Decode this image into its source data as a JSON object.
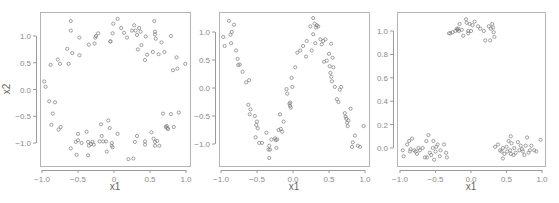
{
  "chart_data": [
    {
      "type": "scatter",
      "panel": 1,
      "title": "",
      "xlabel": "x1",
      "ylabel": "x2",
      "xlim": [
        -1.0,
        1.0
      ],
      "ylim": [
        -1.35,
        1.35
      ],
      "xticks": [
        -1.0,
        -0.5,
        0,
        0.5,
        1.0
      ],
      "xtick_labels": [
        "-1.0",
        "-0.5",
        "0",
        "0.5",
        "1.0"
      ],
      "yticks": [
        1.0,
        0.5,
        0.0,
        -0.5,
        -1.0
      ],
      "ytick_labels": [
        "1.0",
        "0.5",
        "0.0",
        "-0.5",
        "-1.0"
      ],
      "grid": false,
      "marker": "open-circle",
      "description": "Points arranged in a noisy ring (circle of radius ~1)",
      "points": [
        [
          -0.97,
          0.15
        ],
        [
          -0.95,
          0.05
        ],
        [
          -0.88,
          0.46
        ],
        [
          -0.78,
          0.56
        ],
        [
          -0.75,
          0.48
        ],
        [
          -0.65,
          0.76
        ],
        [
          -0.63,
          0.48
        ],
        [
          -0.58,
          0.68
        ],
        [
          -0.6,
          1.1
        ],
        [
          -0.6,
          1.28
        ],
        [
          -0.48,
          0.97
        ],
        [
          -0.48,
          0.64
        ],
        [
          -0.35,
          0.84
        ],
        [
          -0.27,
          0.86
        ],
        [
          -0.26,
          0.97
        ],
        [
          -0.25,
          1.0
        ],
        [
          -0.22,
          1.05
        ],
        [
          -0.05,
          0.9
        ],
        [
          -0.05,
          0.9
        ],
        [
          -0.02,
          1.05
        ],
        [
          -0.01,
          1.23
        ],
        [
          0.05,
          1.32
        ],
        [
          0.1,
          1.15
        ],
        [
          0.14,
          1.06
        ],
        [
          0.18,
          0.97
        ],
        [
          0.25,
          1.1
        ],
        [
          0.28,
          1.2
        ],
        [
          0.3,
          1.1
        ],
        [
          0.32,
          1.02
        ],
        [
          0.33,
          0.75
        ],
        [
          0.35,
          1.15
        ],
        [
          0.37,
          1.08
        ],
        [
          0.38,
          0.83
        ],
        [
          0.43,
          0.55
        ],
        [
          0.44,
          0.99
        ],
        [
          0.46,
          0.65
        ],
        [
          0.54,
          0.7
        ],
        [
          0.56,
          1.28
        ],
        [
          0.57,
          1.08
        ],
        [
          0.57,
          1.03
        ],
        [
          0.58,
          0.95
        ],
        [
          0.62,
          0.66
        ],
        [
          0.66,
          0.88
        ],
        [
          0.7,
          0.7
        ],
        [
          0.79,
          1.0
        ],
        [
          0.82,
          0.36
        ],
        [
          0.87,
          0.6
        ],
        [
          0.88,
          0.39
        ],
        [
          0.99,
          0.48
        ],
        [
          -0.9,
          -0.22
        ],
        [
          -0.82,
          -0.24
        ],
        [
          -0.85,
          -0.45
        ],
        [
          -0.87,
          -0.66
        ],
        [
          -0.77,
          -0.75
        ],
        [
          -0.74,
          -0.7
        ],
        [
          -0.6,
          -1.1
        ],
        [
          -0.53,
          -0.98
        ],
        [
          -0.5,
          -0.83
        ],
        [
          -0.5,
          -0.95
        ],
        [
          -0.52,
          -1.22
        ],
        [
          -0.45,
          -1.0
        ],
        [
          -0.38,
          -0.79
        ],
        [
          -0.36,
          -0.98
        ],
        [
          -0.36,
          -1.23
        ],
        [
          -0.35,
          -1.05
        ],
        [
          -0.32,
          -1.02
        ],
        [
          -0.3,
          -0.98
        ],
        [
          -0.28,
          -1.03
        ],
        [
          -0.2,
          -0.97
        ],
        [
          -0.18,
          -0.65
        ],
        [
          -0.17,
          -0.87
        ],
        [
          -0.15,
          -0.97
        ],
        [
          -0.11,
          -0.97
        ],
        [
          -0.1,
          -1.16
        ],
        [
          -0.08,
          -0.58
        ],
        [
          -0.06,
          -0.72
        ],
        [
          -0.03,
          -1.0
        ],
        [
          -0.03,
          -1.05
        ],
        [
          -0.02,
          -1.08
        ],
        [
          0.05,
          -0.83
        ],
        [
          0.2,
          -1.3
        ],
        [
          0.27,
          -1.29
        ],
        [
          0.29,
          -0.98
        ],
        [
          0.32,
          -0.87
        ],
        [
          0.43,
          -0.97
        ],
        [
          0.43,
          -1.03
        ],
        [
          0.52,
          -0.8
        ],
        [
          0.55,
          -0.92
        ],
        [
          0.57,
          -0.98
        ],
        [
          0.57,
          -1.05
        ],
        [
          0.6,
          -0.96
        ],
        [
          0.63,
          -1.05
        ],
        [
          0.68,
          -0.45
        ],
        [
          0.72,
          -0.7
        ],
        [
          0.73,
          -0.68
        ],
        [
          0.74,
          -0.72
        ],
        [
          0.75,
          -0.74
        ],
        [
          0.79,
          -0.46
        ],
        [
          0.83,
          -0.7
        ],
        [
          0.9,
          -0.43
        ]
      ]
    },
    {
      "type": "scatter",
      "panel": 2,
      "title": "",
      "xlabel": "x1",
      "ylabel": "",
      "xlim": [
        -1.0,
        1.0
      ],
      "ylim": [
        -1.35,
        1.35
      ],
      "xticks": [
        -1.0,
        -0.5,
        0.0,
        0.5,
        1.0
      ],
      "xtick_labels": [
        "-1.0",
        "-0.5",
        "0.0",
        "0.5",
        "1.0"
      ],
      "yticks": [
        1.0,
        0.5,
        0.0,
        -0.5,
        -1.0
      ],
      "ytick_labels": [
        "1.0",
        "0.5",
        "0.0",
        "-0.5",
        "-1.0"
      ],
      "grid": false,
      "marker": "open-circle",
      "description": "Points following a noisy sine-like wave",
      "points": [
        [
          -0.97,
          0.91
        ],
        [
          -0.95,
          0.75
        ],
        [
          -0.89,
          1.2
        ],
        [
          -0.87,
          0.95
        ],
        [
          -0.86,
          0.8
        ],
        [
          -0.85,
          1.0
        ],
        [
          -0.82,
          1.13
        ],
        [
          -0.79,
          0.67
        ],
        [
          -0.77,
          0.52
        ],
        [
          -0.76,
          0.41
        ],
        [
          -0.74,
          0.42
        ],
        [
          -0.7,
          0.29
        ],
        [
          -0.65,
          0.1
        ],
        [
          -0.61,
          0.14
        ],
        [
          -0.62,
          -0.3
        ],
        [
          -0.59,
          -0.38
        ],
        [
          -0.6,
          -0.47
        ],
        [
          -0.53,
          -0.5
        ],
        [
          -0.51,
          -0.66
        ],
        [
          -0.5,
          -0.6
        ],
        [
          -0.49,
          -0.72
        ],
        [
          -0.52,
          -0.88
        ],
        [
          -0.47,
          -0.98
        ],
        [
          -0.43,
          -0.98
        ],
        [
          -0.37,
          -0.8
        ],
        [
          -0.34,
          -1.1
        ],
        [
          -0.33,
          -1.03
        ],
        [
          -0.32,
          -1.1
        ],
        [
          -0.33,
          -1.25
        ],
        [
          -0.3,
          -0.92
        ],
        [
          -0.25,
          -0.9
        ],
        [
          -0.24,
          -0.93
        ],
        [
          -0.23,
          -1.07
        ],
        [
          -0.22,
          -0.92
        ],
        [
          -0.2,
          -0.75
        ],
        [
          -0.18,
          -0.47
        ],
        [
          -0.17,
          -0.73
        ],
        [
          -0.15,
          -0.78
        ],
        [
          -0.13,
          -0.6
        ],
        [
          -0.09,
          -0.02
        ],
        [
          -0.08,
          -0.1
        ],
        [
          -0.05,
          -0.28
        ],
        [
          -0.04,
          -0.26
        ],
        [
          -0.04,
          -0.32
        ],
        [
          -0.03,
          -0.35
        ],
        [
          -0.02,
          0.18
        ],
        [
          -0.01,
          0.02
        ],
        [
          0.03,
          0.37
        ],
        [
          0.06,
          0.63
        ],
        [
          0.1,
          0.67
        ],
        [
          0.14,
          0.75
        ],
        [
          0.19,
          0.84
        ],
        [
          0.18,
          0.56
        ],
        [
          0.24,
          1.1
        ],
        [
          0.26,
          0.67
        ],
        [
          0.28,
          1.25
        ],
        [
          0.28,
          0.96
        ],
        [
          0.3,
          1.15
        ],
        [
          0.31,
          0.8
        ],
        [
          0.32,
          1.08
        ],
        [
          0.33,
          1.12
        ],
        [
          0.35,
          1.1
        ],
        [
          0.38,
          0.87
        ],
        [
          0.4,
          0.78
        ],
        [
          0.42,
          0.84
        ],
        [
          0.43,
          0.47
        ],
        [
          0.45,
          0.87
        ],
        [
          0.47,
          0.49
        ],
        [
          0.5,
          0.61
        ],
        [
          0.51,
          0.39
        ],
        [
          0.53,
          0.79
        ],
        [
          0.52,
          0.27
        ],
        [
          0.53,
          0.2
        ],
        [
          0.55,
          0.54
        ],
        [
          0.54,
          0.12
        ],
        [
          0.56,
          0.37
        ],
        [
          0.58,
          0.02
        ],
        [
          0.61,
          -0.2
        ],
        [
          0.63,
          -0.25
        ],
        [
          0.65,
          -0.03
        ],
        [
          0.67,
          0.02
        ],
        [
          0.72,
          -0.45
        ],
        [
          0.73,
          -0.51
        ],
        [
          0.74,
          -0.55
        ],
        [
          0.75,
          -0.62
        ],
        [
          0.76,
          -0.68
        ],
        [
          0.77,
          -0.58
        ],
        [
          0.8,
          -0.37
        ],
        [
          0.82,
          -1.05
        ],
        [
          0.83,
          -0.97
        ],
        [
          0.86,
          -0.85
        ],
        [
          0.9,
          -1.03
        ],
        [
          0.93,
          -1.05
        ],
        [
          0.98,
          -0.68
        ]
      ]
    },
    {
      "type": "scatter",
      "panel": 3,
      "title": "",
      "xlabel": "x1",
      "ylabel": "",
      "xlim": [
        -1.0,
        1.0
      ],
      "ylim": [
        -0.15,
        1.15
      ],
      "xticks": [
        -1.0,
        -0.5,
        0.0,
        0.5,
        1.0
      ],
      "xtick_labels": [
        "-1.0",
        "-0.5",
        "0.0",
        "0.5",
        "1.0"
      ],
      "yticks": [
        1.0,
        0.8,
        0.6,
        0.4,
        0.2,
        0.0
      ],
      "ytick_labels": [
        "1.0",
        "0.8",
        "0.6",
        "0.4",
        "0.2",
        "0.0"
      ],
      "grid": false,
      "marker": "open-circle",
      "description": "Three clusters: top center (~(0,1)), bottom-left (~(-0.6,0)), bottom-right (~(0.65,0))",
      "points": [
        [
          -0.31,
          0.98
        ],
        [
          -0.29,
          0.98
        ],
        [
          -0.26,
          0.99
        ],
        [
          -0.22,
          1.0
        ],
        [
          -0.2,
          1.02
        ],
        [
          -0.19,
          1.01
        ],
        [
          -0.18,
          1.02
        ],
        [
          -0.17,
          1.0
        ],
        [
          -0.16,
          1.06
        ],
        [
          -0.13,
          1.01
        ],
        [
          -0.11,
          0.96
        ],
        [
          -0.07,
          1.1
        ],
        [
          -0.06,
          1.07
        ],
        [
          -0.04,
          0.98
        ],
        [
          -0.04,
          1.0
        ],
        [
          -0.02,
          1.06
        ],
        [
          0.0,
          1.0
        ],
        [
          0.02,
          1.05
        ],
        [
          0.05,
          1.08
        ],
        [
          0.1,
          1.04
        ],
        [
          0.13,
          1.02
        ],
        [
          0.18,
          1.0
        ],
        [
          0.2,
          0.92
        ],
        [
          0.25,
          1.04
        ],
        [
          0.27,
          0.92
        ],
        [
          0.28,
          1.02
        ],
        [
          0.3,
          1.06
        ],
        [
          0.31,
          1.03
        ],
        [
          0.32,
          0.99
        ],
        [
          0.33,
          0.95
        ],
        [
          -0.96,
          -0.02
        ],
        [
          -0.95,
          -0.07
        ],
        [
          -0.9,
          0.03
        ],
        [
          -0.87,
          0.06
        ],
        [
          -0.86,
          -0.03
        ],
        [
          -0.85,
          -0.01
        ],
        [
          -0.83,
          0.08
        ],
        [
          -0.8,
          -0.02
        ],
        [
          -0.78,
          -0.03
        ],
        [
          -0.76,
          -0.05
        ],
        [
          -0.74,
          0.0
        ],
        [
          -0.72,
          -0.02
        ],
        [
          -0.68,
          0.0
        ],
        [
          -0.65,
          -0.08
        ],
        [
          -0.63,
          0.06
        ],
        [
          -0.62,
          -0.08
        ],
        [
          -0.6,
          0.11
        ],
        [
          -0.58,
          -0.04
        ],
        [
          -0.56,
          -0.06
        ],
        [
          -0.54,
          0.0
        ],
        [
          -0.53,
          0.06
        ],
        [
          -0.52,
          -0.1
        ],
        [
          -0.5,
          -0.03
        ],
        [
          -0.49,
          0.01
        ],
        [
          -0.47,
          0.03
        ],
        [
          -0.44,
          -0.07
        ],
        [
          -0.43,
          -0.02
        ],
        [
          -0.38,
          0.03
        ],
        [
          -0.35,
          -0.04
        ],
        [
          -0.34,
          -0.08
        ],
        [
          0.34,
          0.01
        ],
        [
          0.38,
          0.03
        ],
        [
          0.41,
          -0.02
        ],
        [
          0.43,
          -0.03
        ],
        [
          0.45,
          0.0
        ],
        [
          0.45,
          -0.09
        ],
        [
          0.47,
          -0.05
        ],
        [
          0.5,
          0.01
        ],
        [
          0.51,
          -0.03
        ],
        [
          0.53,
          0.06
        ],
        [
          0.55,
          -0.02
        ],
        [
          0.56,
          -0.05
        ],
        [
          0.56,
          0.1
        ],
        [
          0.57,
          0.04
        ],
        [
          0.6,
          -0.06
        ],
        [
          0.61,
          0.0
        ],
        [
          0.63,
          -0.04
        ],
        [
          0.66,
          0.05
        ],
        [
          0.68,
          -0.02
        ],
        [
          0.7,
          0.02
        ],
        [
          0.72,
          -0.01
        ],
        [
          0.73,
          -0.03
        ],
        [
          0.75,
          -0.06
        ],
        [
          0.77,
          0.02
        ],
        [
          0.79,
          0.09
        ],
        [
          0.81,
          -0.04
        ],
        [
          0.83,
          -0.02
        ],
        [
          0.85,
          0.02
        ],
        [
          0.89,
          -0.02
        ],
        [
          0.92,
          -0.03
        ],
        [
          0.98,
          0.07
        ]
      ]
    }
  ],
  "layout": {
    "panels": [
      {
        "left": 40,
        "top": 12,
        "right": 190,
        "bottom": 166,
        "x_at_min": 42,
        "x_at_max": 186,
        "y_ref": [
          [
            1.0,
            36
          ],
          [
            -1.0,
            143
          ]
        ],
        "show_ylabel": true
      },
      {
        "left": 219,
        "top": 12,
        "right": 369,
        "bottom": 166,
        "x_at_min": 221,
        "x_at_max": 365,
        "y_ref": [
          [
            1.0,
            32
          ],
          [
            -1.0,
            144
          ]
        ],
        "show_ylabel": false
      },
      {
        "left": 397,
        "top": 12,
        "right": 545,
        "bottom": 166,
        "x_at_min": 400,
        "x_at_max": 542,
        "y_ref": [
          [
            1.0,
            31
          ],
          [
            0.0,
            148
          ]
        ],
        "show_ylabel": false
      }
    ]
  }
}
